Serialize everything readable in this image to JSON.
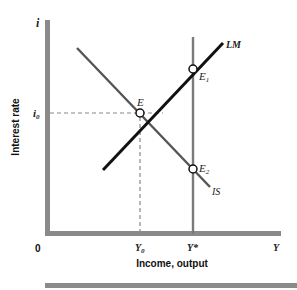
{
  "diagram": {
    "type": "IS-LM diagram",
    "axes": {
      "y_symbol": "i",
      "y_label": "Interest rate",
      "x_label": "Income, output",
      "origin_label": "0",
      "x_end_symbol": "Y"
    },
    "levels": {
      "interest_rate_equilibrium": "i",
      "interest_rate_equilibrium_sub": "0",
      "income_equilibrium": "Y",
      "income_equilibrium_sub": "0",
      "full_employment_income": "Y*"
    },
    "curves": [
      {
        "name": "LM",
        "label": "LM",
        "slope": "upward",
        "color": "#111111"
      },
      {
        "name": "IS",
        "label": "IS",
        "slope": "downward",
        "color": "#555555"
      },
      {
        "name": "full-employment-line",
        "label": "",
        "slope": "vertical",
        "at": "Y*",
        "color": "#7a7a7a"
      }
    ],
    "points": [
      {
        "label": "E",
        "sub": "",
        "description": "IS-LM intersection at (Y0, i0)"
      },
      {
        "label": "E",
        "sub": "1",
        "description": "LM intersects Y*"
      },
      {
        "label": "E",
        "sub": "2",
        "description": "IS intersects Y*"
      }
    ],
    "colors": {
      "axis": "#8a8a8a",
      "lm": "#111111",
      "is": "#555555",
      "vertical": "#7a7a7a",
      "dashed": "#888888",
      "bottom_rule": "#8a8a8a"
    }
  }
}
